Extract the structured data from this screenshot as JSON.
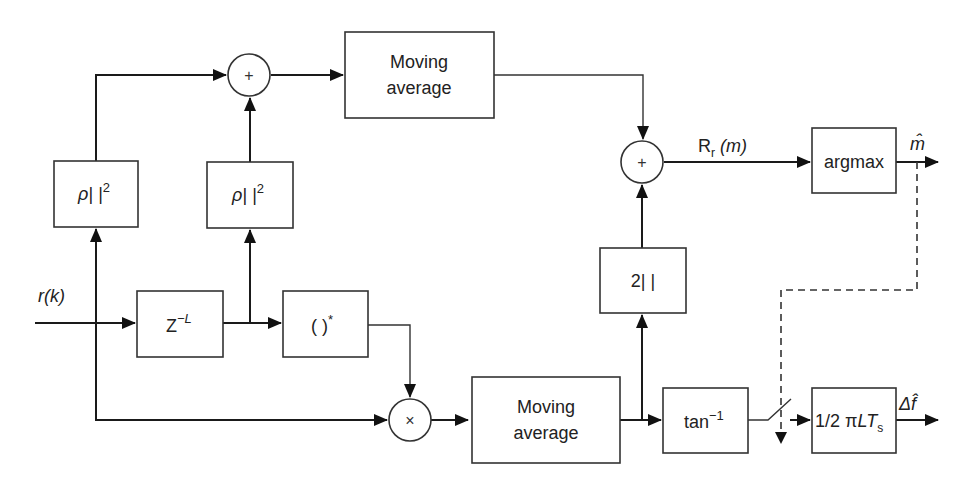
{
  "diagram": {
    "type": "signal-processing block diagram",
    "input_label": "r(k)",
    "blocks": {
      "power_1": {
        "label": "ρ| |",
        "sup": "2"
      },
      "power_2": {
        "label": "ρ| |",
        "sup": "2"
      },
      "delay": {
        "label": "Z",
        "sup": "−L"
      },
      "conjugate": {
        "label": "( )",
        "sup": "*"
      },
      "moving_avg_top": {
        "line1": "Moving",
        "line2": "average"
      },
      "moving_avg_bottom": {
        "line1": "Moving",
        "line2": "average"
      },
      "abs2": {
        "label": "2| |"
      },
      "arctan": {
        "label": "tan",
        "sup": "−1"
      },
      "argmax": {
        "label": "argmax"
      },
      "scale": {
        "label": "1/2 π",
        "it": "LT",
        "sub": "s"
      }
    },
    "operators": {
      "sum_top": "+",
      "sum_right": "+",
      "multiply": "×"
    },
    "signals": {
      "metric_label": "R",
      "metric_sub": "r",
      "metric_arg": " (m)",
      "output_timing": "m̂",
      "output_freq": "Δf̂"
    }
  }
}
